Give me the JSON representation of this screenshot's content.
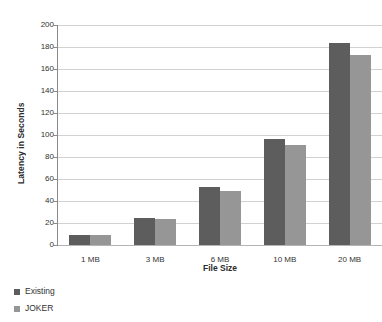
{
  "chart_data": {
    "type": "bar",
    "title": "",
    "xlabel": "File Size",
    "ylabel": "Latency in Seconds",
    "categories": [
      "1 MB",
      "3 MB",
      "6 MB",
      "10 MB",
      "20 MB"
    ],
    "series": [
      {
        "name": "Existing",
        "color": "#5d5d5d",
        "values": [
          9,
          25,
          53,
          96,
          184
        ]
      },
      {
        "name": "JOKER",
        "color": "#969696",
        "values": [
          9,
          24,
          49,
          91,
          173
        ]
      }
    ],
    "ylim": [
      0,
      200
    ],
    "ytick_step": 20,
    "yticks": [
      0,
      20,
      40,
      60,
      80,
      100,
      120,
      140,
      160,
      180,
      200
    ],
    "ytick_labels": [
      "0",
      "20",
      "40",
      "60",
      "80",
      "100",
      "120",
      "140",
      "160",
      "180",
      "200"
    ],
    "grid": true,
    "grid_axis": "y",
    "legend_position": "bottom-left",
    "legend_orientation": "vertical",
    "background": "#ffffff",
    "gridline_color": "#d2d2d2",
    "axis_color": "#8a8a8a"
  }
}
